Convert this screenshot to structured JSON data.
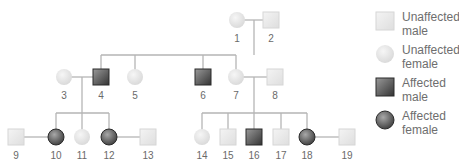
{
  "colors": {
    "line": "#b5b5b5",
    "unaffected_fill": "#e9e9e9",
    "affected_fill": "#5a5a5a",
    "label": "#6a6a6a"
  },
  "individuals": [
    {
      "id": "1",
      "sex": "female",
      "affected": false,
      "x": 237,
      "y": 20
    },
    {
      "id": "2",
      "sex": "male",
      "affected": false,
      "x": 271,
      "y": 20
    },
    {
      "id": "3",
      "sex": "female",
      "affected": false,
      "x": 64,
      "y": 77
    },
    {
      "id": "4",
      "sex": "male",
      "affected": true,
      "x": 101,
      "y": 77
    },
    {
      "id": "5",
      "sex": "female",
      "affected": false,
      "x": 135,
      "y": 77
    },
    {
      "id": "6",
      "sex": "male",
      "affected": true,
      "x": 203,
      "y": 77
    },
    {
      "id": "7",
      "sex": "female",
      "affected": false,
      "x": 236,
      "y": 77
    },
    {
      "id": "8",
      "sex": "male",
      "affected": false,
      "x": 275,
      "y": 77
    },
    {
      "id": "9",
      "sex": "male",
      "affected": false,
      "x": 16,
      "y": 137
    },
    {
      "id": "10",
      "sex": "female",
      "affected": true,
      "x": 56,
      "y": 137
    },
    {
      "id": "11",
      "sex": "female",
      "affected": false,
      "x": 82,
      "y": 137
    },
    {
      "id": "12",
      "sex": "female",
      "affected": true,
      "x": 109,
      "y": 137
    },
    {
      "id": "13",
      "sex": "male",
      "affected": false,
      "x": 148,
      "y": 137
    },
    {
      "id": "14",
      "sex": "female",
      "affected": false,
      "x": 202,
      "y": 137
    },
    {
      "id": "15",
      "sex": "male",
      "affected": false,
      "x": 228,
      "y": 137
    },
    {
      "id": "16",
      "sex": "male",
      "affected": true,
      "x": 254,
      "y": 137
    },
    {
      "id": "17",
      "sex": "male",
      "affected": false,
      "x": 281,
      "y": 137
    },
    {
      "id": "18",
      "sex": "female",
      "affected": true,
      "x": 307,
      "y": 137
    },
    {
      "id": "19",
      "sex": "male",
      "affected": false,
      "x": 347,
      "y": 137
    }
  ],
  "legend": [
    {
      "label": "Unaffected male",
      "sex": "male",
      "affected": false
    },
    {
      "label": "Unaffected female",
      "sex": "female",
      "affected": false
    },
    {
      "label": "Affected male",
      "sex": "male",
      "affected": true
    },
    {
      "label": "Affected female",
      "sex": "female",
      "affected": true
    }
  ]
}
